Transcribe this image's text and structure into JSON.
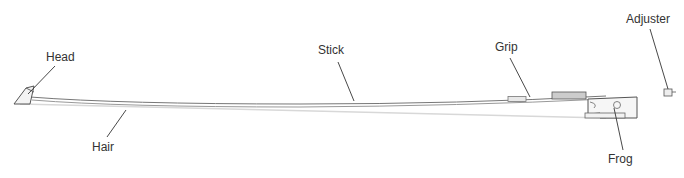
{
  "diagram": {
    "labels": {
      "head": "Head",
      "stick": "Stick",
      "grip": "Grip",
      "adjuster": "Adjuster",
      "hair": "Hair",
      "frog": "Frog"
    },
    "colors": {
      "stroke": "#555555",
      "leader": "#333333",
      "grip_fill": "#cccccc",
      "hair": "#dddddd",
      "text": "#333333"
    }
  }
}
